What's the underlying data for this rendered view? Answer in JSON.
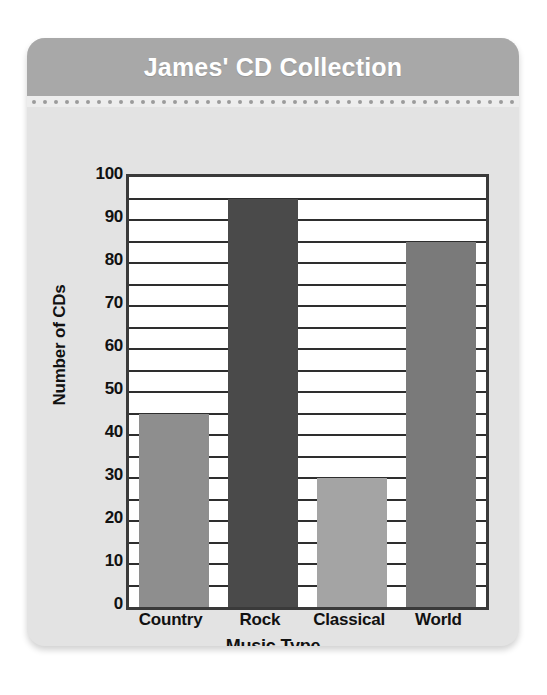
{
  "card": {
    "title": "James' CD Collection",
    "header_color": "#a8a8a8",
    "body_color": "#e3e3e3",
    "title_color": "#ffffff"
  },
  "chart_data": {
    "type": "bar",
    "title": "James' CD Collection",
    "xlabel": "Music Type",
    "ylabel": "Number of CDs",
    "categories": [
      "Country",
      "Rock",
      "Classical",
      "World"
    ],
    "values": [
      45,
      95,
      30,
      85
    ],
    "series": [
      {
        "name": "Number of CDs",
        "values": [
          45,
          95,
          30,
          85
        ]
      }
    ],
    "bar_colors": [
      "#8e8e8e",
      "#4a4a4a",
      "#a4a4a4",
      "#7a7a7a"
    ],
    "ylim": [
      0,
      100
    ],
    "major_tick_step": 10,
    "minor_gridline_step": 5,
    "ytick_labels": [
      "100",
      "90",
      "80",
      "70",
      "60",
      "50",
      "40",
      "30",
      "20",
      "10",
      "0"
    ],
    "ytick_values": [
      100,
      90,
      80,
      70,
      60,
      50,
      40,
      30,
      20,
      10,
      0
    ],
    "gridlines": [
      95,
      90,
      85,
      80,
      75,
      70,
      65,
      60,
      55,
      50,
      45,
      40,
      35,
      30,
      25,
      20,
      15,
      10,
      5
    ],
    "grid": true,
    "legend": "none",
    "plot_background": "#ffffff",
    "axis_color": "#3a3a3a"
  }
}
